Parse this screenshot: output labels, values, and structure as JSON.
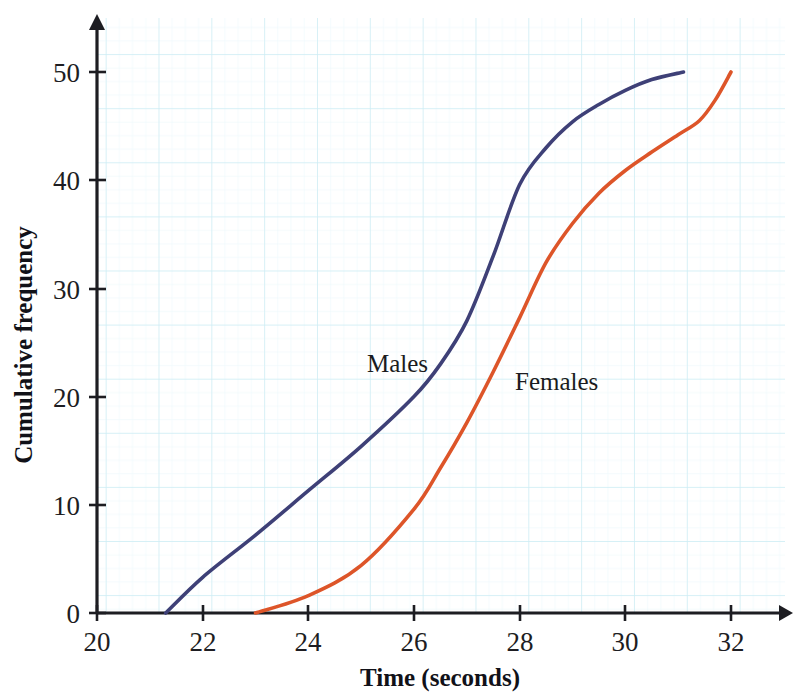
{
  "figure": {
    "clipped_header": "Cumulative frequency diagram of times for males and females",
    "background_color": "#ffffff",
    "grid_color": "#cdeef5",
    "grid_minor_color": "#e6f6fa",
    "axis_color": "#1d1d22"
  },
  "axes": {
    "x_title": "Time (seconds)",
    "y_title": "Cumulative frequency",
    "x_ticks": [
      "20",
      "22",
      "24",
      "26",
      "28",
      "30",
      "32"
    ],
    "y_ticks": [
      "0",
      "10",
      "20",
      "30",
      "40",
      "50"
    ]
  },
  "labels": {
    "males": "Males",
    "females": "Females"
  },
  "chart_data": {
    "type": "line",
    "title": "Cumulative frequency diagram of times for males and females",
    "xlabel": "Time (seconds)",
    "ylabel": "Cumulative frequency",
    "xlim": [
      20,
      32
    ],
    "ylim": [
      0,
      50
    ],
    "xticks": [
      20,
      22,
      24,
      26,
      28,
      30,
      32
    ],
    "yticks": [
      0,
      10,
      20,
      30,
      40,
      50
    ],
    "grid": true,
    "legend": "inline-annotations",
    "series": [
      {
        "name": "Males",
        "color": "#3e4077",
        "points": [
          [
            21.3,
            0.0
          ],
          [
            22.0,
            3.3
          ],
          [
            23.0,
            7.2
          ],
          [
            24.0,
            11.3
          ],
          [
            25.0,
            15.4
          ],
          [
            26.0,
            20.0
          ],
          [
            26.5,
            23.0
          ],
          [
            27.0,
            27.0
          ],
          [
            27.5,
            33.0
          ],
          [
            28.0,
            39.6
          ],
          [
            28.5,
            43.0
          ],
          [
            29.0,
            45.4
          ],
          [
            29.5,
            47.0
          ],
          [
            30.0,
            48.3
          ],
          [
            30.5,
            49.3
          ],
          [
            31.1,
            50.0
          ]
        ]
      },
      {
        "name": "Females",
        "color": "#dd5529",
        "points": [
          [
            23.0,
            0.0
          ],
          [
            24.0,
            1.6
          ],
          [
            25.0,
            4.4
          ],
          [
            26.0,
            9.6
          ],
          [
            26.5,
            13.4
          ],
          [
            27.0,
            17.6
          ],
          [
            27.5,
            22.3
          ],
          [
            28.0,
            27.3
          ],
          [
            28.5,
            32.4
          ],
          [
            29.0,
            36.0
          ],
          [
            29.5,
            38.8
          ],
          [
            30.0,
            40.9
          ],
          [
            30.5,
            42.6
          ],
          [
            31.0,
            44.2
          ],
          [
            31.4,
            45.5
          ],
          [
            31.7,
            47.4
          ],
          [
            32.0,
            50.0
          ]
        ]
      }
    ]
  }
}
